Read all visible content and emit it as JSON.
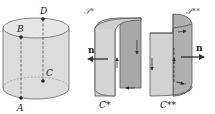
{
  "figure": {
    "cylinder": {
      "points": [
        {
          "label": "A"
        },
        {
          "label": "B"
        },
        {
          "label": "C"
        },
        {
          "label": "D"
        }
      ]
    },
    "left_surface": {
      "surface_label": "𝒮*",
      "curve_label": "C*",
      "normal_label": "n"
    },
    "right_surface": {
      "surface_label": "𝒮**",
      "curve_label": "C**",
      "normal_label": "n"
    },
    "colors": {
      "surface_fill": "#d4d4d4",
      "surface_dark": "#a9a9a9",
      "outline": "#555555",
      "point": "#222222"
    }
  }
}
